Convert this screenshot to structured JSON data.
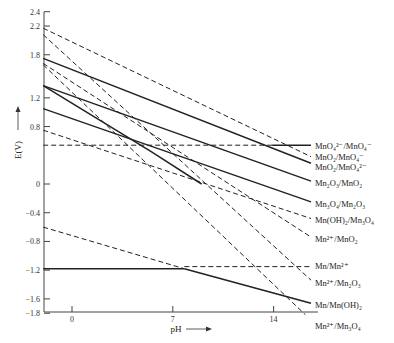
{
  "chart_data": {
    "type": "line",
    "title": "",
    "xlabel": "pH",
    "ylabel": "E(V)",
    "xlim": [
      -2,
      16.5
    ],
    "ylim": [
      -1.8,
      2.5
    ],
    "grid": false,
    "x_ticks": [
      0,
      7,
      14
    ],
    "y_ticks": [
      2.4,
      2.2,
      1.8,
      1.2,
      0.8,
      0,
      -0.4,
      -0.8,
      -1.2,
      -1.6,
      -1.8
    ],
    "y_tick_labels": [
      "2.4",
      "2.2",
      "1.8",
      "1.2",
      "0.8",
      "0",
      "−0.4",
      "−0.8",
      "−1.2",
      "−1.6",
      "−1.8"
    ],
    "x_tick_labels": [
      "0",
      "7",
      "14"
    ],
    "series": [
      {
        "name": "MnO4²⁻/MnO4⁻",
        "style": "mixed",
        "segments": [
          {
            "style": "dashed",
            "points": [
              [
                -2,
                0.54
              ],
              [
                13.9,
                0.54
              ]
            ]
          },
          {
            "style": "solid",
            "points": [
              [
                13.9,
                0.54
              ],
              [
                16.6,
                0.54
              ]
            ]
          }
        ]
      },
      {
        "name": "MnO2/MnO4⁻",
        "style": "dashed",
        "points": [
          [
            -2,
            2.17
          ],
          [
            16.6,
            0.38
          ]
        ]
      },
      {
        "name": "MnO2/MnO4²⁻",
        "style": "solid",
        "points": [
          [
            -2,
            1.75
          ],
          [
            16.6,
            0.29
          ]
        ]
      },
      {
        "name": "Mn2O3/MnO2",
        "style": "solid",
        "points": [
          [
            -2,
            1.37
          ],
          [
            16.6,
            0.04
          ]
        ]
      },
      {
        "name": "Mn3O4/Mn2O3",
        "style": "solid",
        "points": [
          [
            -2,
            1.05
          ],
          [
            16.6,
            -0.25
          ]
        ]
      },
      {
        "name": "Mn(OH)2/Mn3O4",
        "style": "dashed",
        "points": [
          [
            -2,
            0.75
          ],
          [
            16.6,
            -0.48
          ]
        ]
      },
      {
        "name": "Mn²⁺/MnO2",
        "style": "dashed",
        "points": [
          [
            -2,
            1.68
          ],
          [
            16.6,
            -0.74
          ]
        ]
      },
      {
        "name": "Mn/Mn²⁺",
        "style": "mixed",
        "segments": [
          {
            "style": "solid",
            "points": [
              [
                -2,
                -1.18
              ],
              [
                7.8,
                -1.18
              ]
            ]
          },
          {
            "style": "dashed",
            "points": [
              [
                7.8,
                -1.15
              ],
              [
                16.6,
                -1.15
              ]
            ]
          }
        ]
      },
      {
        "name": "Mn²⁺/Mn2O3",
        "style": "dashed",
        "points": [
          [
            -2,
            2.08
          ],
          [
            16.6,
            -1.34
          ]
        ]
      },
      {
        "name": "Mn/Mn(OH)2",
        "style": "mixed",
        "segments": [
          {
            "style": "dashed",
            "points": [
              [
                -2,
                -0.6
              ],
              [
                7.8,
                -1.18
              ]
            ]
          },
          {
            "style": "solid",
            "points": [
              [
                7.8,
                -1.18
              ],
              [
                16.6,
                -1.66
              ]
            ]
          }
        ]
      },
      {
        "name": "Mn²⁺/Mn3O4",
        "style": "dashed",
        "points": [
          [
            -2,
            1.66
          ],
          [
            16.2,
            -1.82
          ]
        ]
      },
      {
        "name": "solid-steep",
        "style": "solid",
        "points": [
          [
            -2,
            1.37
          ],
          [
            5.5,
            0.45
          ],
          [
            9,
            0.0
          ]
        ]
      }
    ]
  },
  "labels": {
    "y_axis": "E(V)",
    "x_axis": "pH",
    "curves": [
      {
        "text": "MnO₄²⁻/MnO₄⁻",
        "y": 146
      },
      {
        "text": "MnO₂/MnO₄⁻",
        "y": 157
      },
      {
        "text": "MnO₂/MnO₄²⁻",
        "y": 167
      },
      {
        "text": "Mn₂O₃/MnO₂",
        "y": 183
      },
      {
        "text": "Mn₃O₄/Mn₂O₃",
        "y": 204
      },
      {
        "text": "Mn(OH)₂/Mn₃O₄",
        "y": 220
      },
      {
        "text": "Mn²⁺/MnO₂",
        "y": 239
      },
      {
        "text": "Mn/Mn²⁺",
        "y": 266
      },
      {
        "text": "Mn²⁺/Mn₂O₃",
        "y": 283
      },
      {
        "text": "Mn/Mn(OH)₂",
        "y": 305
      },
      {
        "text": "Mn²⁺/Mn₃O₄",
        "y": 326
      }
    ]
  }
}
